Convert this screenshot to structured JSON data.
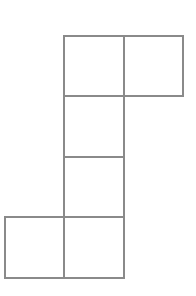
{
  "diagram": {
    "type": "square-net",
    "line_color": "#8a8a8a",
    "cells": [
      {
        "row": 0,
        "col": 1
      },
      {
        "row": 0,
        "col": 2
      },
      {
        "row": 1,
        "col": 1
      },
      {
        "row": 2,
        "col": 1
      },
      {
        "row": 3,
        "col": 0
      },
      {
        "row": 3,
        "col": 1
      }
    ]
  }
}
